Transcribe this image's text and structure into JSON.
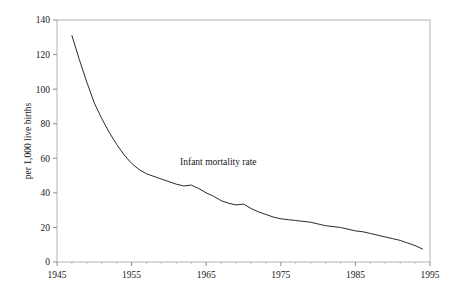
{
  "chart_data": {
    "type": "line",
    "title": "",
    "subtitle": "",
    "xlabel": "",
    "ylabel": "per 1,000 live births",
    "annotation": "Infant mortality rate",
    "grid": false,
    "legend": "none",
    "xlim": [
      1945,
      1995
    ],
    "ylim": [
      0,
      140
    ],
    "xticks": [
      1945,
      1955,
      1965,
      1975,
      1985,
      1995
    ],
    "xtick_labels": [
      "1945",
      "1955",
      "1965",
      "1975",
      "1985",
      "1995"
    ],
    "yticks": [
      0,
      20,
      40,
      60,
      80,
      100,
      120,
      140
    ],
    "ytick_labels": [
      "0",
      "20",
      "40",
      "60",
      "80",
      "100",
      "120",
      "140"
    ],
    "x_minor_interval": 2,
    "series": [
      {
        "name": "Infant mortality rate",
        "color": "#2b2b2b",
        "x": [
          1947,
          1948,
          1949,
          1950,
          1951,
          1952,
          1953,
          1954,
          1955,
          1956,
          1957,
          1958,
          1959,
          1960,
          1961,
          1962,
          1963,
          1964,
          1965,
          1966,
          1967,
          1968,
          1969,
          1970,
          1971,
          1972,
          1973,
          1974,
          1975,
          1976,
          1977,
          1978,
          1979,
          1980,
          1981,
          1982,
          1983,
          1984,
          1985,
          1986,
          1987,
          1988,
          1989,
          1990,
          1991,
          1992,
          1993,
          1994
        ],
        "y": [
          131.0,
          117.0,
          104.0,
          92.0,
          83.0,
          75.0,
          68.0,
          62.0,
          57.0,
          53.5,
          51.0,
          49.5,
          48.0,
          46.5,
          45.0,
          44.0,
          44.5,
          42.5,
          40.0,
          38.0,
          35.5,
          34.0,
          33.0,
          33.5,
          31.0,
          29.0,
          27.5,
          26.0,
          25.0,
          24.5,
          24.0,
          23.5,
          23.0,
          22.0,
          21.0,
          20.5,
          20.0,
          19.0,
          18.0,
          17.5,
          16.5,
          15.5,
          14.5,
          13.5,
          12.5,
          11.0,
          9.5,
          7.5
        ]
      }
    ]
  },
  "geometry": {
    "plot_left": 57,
    "plot_right": 430,
    "plot_top": 20,
    "plot_bottom": 262
  }
}
